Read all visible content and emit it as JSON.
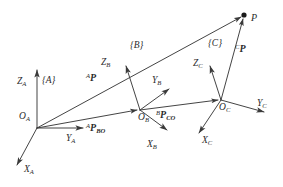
{
  "figure": {
    "kind": "coordinate-frames-diagram",
    "stroke_color": "#3a3a3a",
    "text_color": "#2b2b2b",
    "background": "#ffffff",
    "point_marker_color": "#1a1a1a"
  },
  "frames": [
    {
      "id": "A",
      "brace_label": "{A}",
      "origin_label": "O",
      "origin_subscript": "A",
      "origin_xy": [
        37,
        128
      ],
      "axes": [
        {
          "name": "Z",
          "subscript": "A",
          "label_x": 18,
          "label_y": 82,
          "tip": [
            37,
            67
          ]
        },
        {
          "name": "Y",
          "subscript": "A",
          "label_x": 65,
          "label_y": 142,
          "tip": [
            86,
            128
          ]
        },
        {
          "name": "X",
          "subscript": "A",
          "label_x": 23,
          "label_y": 172,
          "tip": [
            14,
            168
          ]
        }
      ]
    },
    {
      "id": "B",
      "brace_label": "{B}",
      "origin_label": "O",
      "origin_subscript": "B",
      "origin_xy": [
        140,
        110
      ],
      "axes": [
        {
          "name": "Z",
          "subscript": "B",
          "label_x": 102,
          "label_y": 64,
          "tip": [
            124,
            62
          ]
        },
        {
          "name": "Y",
          "subscript": "B",
          "label_x": 151,
          "label_y": 82,
          "tip": [
            172,
            86
          ]
        },
        {
          "name": "X",
          "subscript": "B",
          "label_x": 146,
          "label_y": 148,
          "tip": [
            170,
            132
          ]
        }
      ]
    },
    {
      "id": "C",
      "brace_label": "{C}",
      "origin_label": "O",
      "origin_subscript": "C",
      "origin_xy": [
        221,
        100
      ],
      "axes": [
        {
          "name": "Z",
          "subscript": "C",
          "label_x": 194,
          "label_y": 66,
          "tip": [
            208,
            62
          ]
        },
        {
          "name": "Y",
          "subscript": "C",
          "label_x": 256,
          "label_y": 106,
          "tip": [
            267,
            114
          ]
        },
        {
          "name": "X",
          "subscript": "C",
          "label_x": 201,
          "label_y": 144,
          "tip": [
            196,
            135
          ]
        }
      ]
    }
  ],
  "frame_label_positions": {
    "A": {
      "x": 42,
      "y": 81
    },
    "B": {
      "x": 130,
      "y": 46
    },
    "C": {
      "x": 208,
      "y": 44
    }
  },
  "point": {
    "label": "P",
    "xy": [
      244,
      15
    ],
    "label_x": 251,
    "label_y": 19
  },
  "vectors": [
    {
      "name": "A_P",
      "superscript": "A",
      "symbol": "P",
      "subscript": "",
      "from": [
        37,
        128
      ],
      "to": [
        244,
        15
      ],
      "label_x": 88,
      "label_y": 79,
      "description": "position of P expressed in frame A"
    },
    {
      "name": "A_P_BO",
      "superscript": "A",
      "symbol": "P",
      "subscript": "BO",
      "from": [
        37,
        128
      ],
      "to": [
        140,
        110
      ],
      "label_x": 88,
      "label_y": 129,
      "description": "origin of frame B expressed in frame A"
    },
    {
      "name": "B_P_CO",
      "superscript": "B",
      "symbol": "P",
      "subscript": "CO",
      "from": [
        140,
        110
      ],
      "to": [
        221,
        100
      ],
      "label_x": 156,
      "label_y": 117,
      "description": "origin of frame C expressed in frame B"
    },
    {
      "name": "C_P",
      "superscript": "C",
      "symbol": "P",
      "subscript": "",
      "from": [
        221,
        100
      ],
      "to": [
        244,
        15
      ],
      "label_x": 235,
      "label_y": 50,
      "description": "position of P expressed in frame C"
    }
  ]
}
